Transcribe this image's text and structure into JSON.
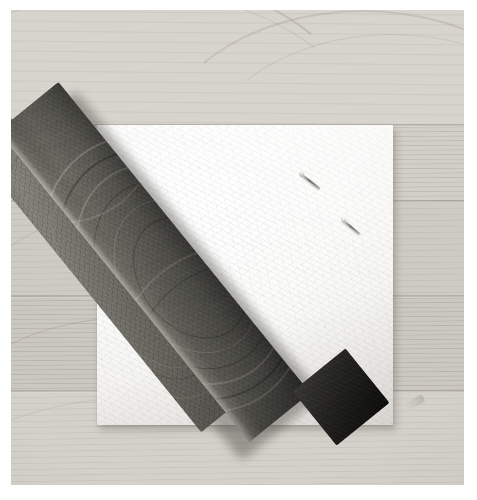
{
  "image": {
    "domain": "Natural-Image",
    "title": "Dark banded stone bar resting diagonally on a white foam pad",
    "caption": "",
    "canvas": {
      "width": 477,
      "height": 500,
      "background": "#ffffff"
    },
    "photo_frame": {
      "left": 11,
      "top": 10,
      "width": 453,
      "height": 475
    }
  },
  "palette": {
    "page_background": "#ffffff",
    "wood_light": "#d5d2cb",
    "wood_mid": "#cbc8c1",
    "wood_shadow": "#a9a59d",
    "pad_white": "#ffffff",
    "pad_offwhite": "#f2f1ee",
    "stone_light": "#85857d",
    "stone_mid": "#61605a",
    "stone_dark": "#3d3c38",
    "stone_darkest": "#1d1c1a",
    "pin_metal": "#6e6d6a"
  },
  "scene": {
    "background_label": "light wood plank surface",
    "planks": [
      {
        "name": "plank-1",
        "top": 0,
        "height": 115,
        "tone": "#d7d4cd",
        "grain": "sparse"
      },
      {
        "name": "plank-2",
        "top": 115,
        "height": 75,
        "tone": "#d2cfc8",
        "grain": "dense"
      },
      {
        "name": "plank-3",
        "top": 190,
        "height": 95,
        "tone": "#cecbc4",
        "grain": "normal"
      },
      {
        "name": "plank-4",
        "top": 285,
        "height": 95,
        "tone": "#cbc8c1",
        "grain": "dense"
      },
      {
        "name": "plank-5",
        "top": 380,
        "height": 95,
        "tone": "#d4d1ca",
        "grain": "normal"
      }
    ],
    "seams": [
      115,
      190,
      285,
      380
    ],
    "pad": {
      "label": "white foam / felt square pad",
      "left": 86,
      "top": 115,
      "width": 296,
      "height": 300,
      "color": "#ffffff"
    },
    "stone_bar": {
      "label": "dark grey banded stone bar (slate / stromatolite)",
      "orientation": "diagonal, upper-left to lower-right",
      "angle_degrees": -39,
      "tip_top": {
        "x": 120,
        "y": 62
      },
      "tip_bottom": {
        "x": 420,
        "y": 428
      }
    },
    "pins": [
      {
        "name": "pin-1",
        "left": 290,
        "top": 163,
        "length": 24,
        "angle": 38
      },
      {
        "name": "pin-2",
        "left": 332,
        "top": 209,
        "length": 22,
        "angle": 40
      },
      {
        "name": "pin-3",
        "left": 151,
        "top": 291,
        "length": 23,
        "angle": 37
      },
      {
        "name": "pin-4",
        "left": 191,
        "top": 329,
        "length": 21,
        "angle": 39
      }
    ]
  }
}
